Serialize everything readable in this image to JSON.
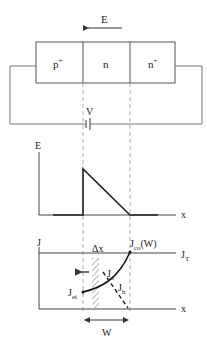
{
  "device": {
    "field_label": "E",
    "regions": [
      {
        "label": "p",
        "sup": "+"
      },
      {
        "label": "n",
        "sup": ""
      },
      {
        "label": "n",
        "sup": "+"
      }
    ],
    "bias_label": "V"
  },
  "field_plot": {
    "y_label": "E",
    "x_label": "x"
  },
  "current_plot": {
    "y_label": "J",
    "x_label": "x",
    "total_label": {
      "main": "J",
      "sub": "T"
    },
    "jco_label": {
      "main": "J",
      "sub": "co",
      "suffix": "(W)"
    },
    "jei_label": {
      "main": "J",
      "sub": "ei"
    },
    "je_label": {
      "main": "J",
      "sub": "e"
    },
    "jh_label": {
      "main": "J",
      "sub": "h"
    },
    "dx_label": "Δx",
    "width_label": "W"
  },
  "colors": {
    "line": "#333333",
    "wire": "#777777",
    "dash": "#999999",
    "curve": "#111111"
  }
}
